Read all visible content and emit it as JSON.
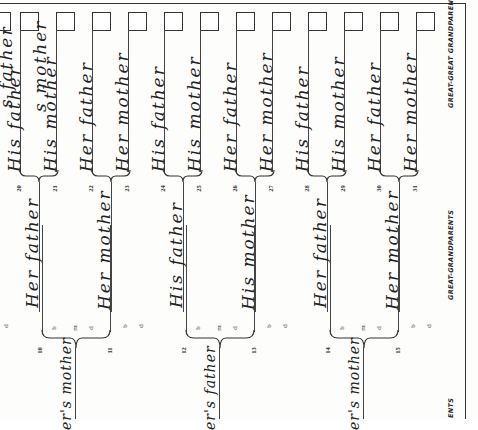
{
  "chart": {
    "title_columns": {
      "great_grandparents": "GREAT-GRANDPARENTS",
      "great_great_grandparents": "GREAT-GREAT GRANDPARENTS",
      "grandparents_partial": "ENTS"
    },
    "event_abbrev": {
      "birth": "b",
      "marriage": "m",
      "death": "d"
    },
    "great_great_grandparents": [
      {
        "number": "20",
        "label": "His father"
      },
      {
        "number": "21",
        "label": "His mother"
      },
      {
        "number": "22",
        "label": "Her father"
      },
      {
        "number": "23",
        "label": "Her mother"
      },
      {
        "number": "24",
        "label": "His father"
      },
      {
        "number": "25",
        "label": "His mother"
      },
      {
        "number": "26",
        "label": "Her father"
      },
      {
        "number": "27",
        "label": "Her mother"
      },
      {
        "number": "28",
        "label": "His father"
      },
      {
        "number": "29",
        "label": "His mother"
      },
      {
        "number": "30",
        "label": "Her father"
      },
      {
        "number": "31",
        "label": "Her mother"
      }
    ],
    "partial_top_labels": [
      {
        "label": "s father"
      },
      {
        "label": "s mother"
      }
    ],
    "great_grandparents": [
      {
        "number": "10",
        "label": "Her father"
      },
      {
        "number": "11",
        "label": "Her mother"
      },
      {
        "number": "12",
        "label": "His father"
      },
      {
        "number": "13",
        "label": "His mother"
      },
      {
        "number": "14",
        "label": "Her father"
      },
      {
        "number": "15",
        "label": "Her mother"
      }
    ],
    "grandparents_partial": [
      {
        "label": "er's mother"
      },
      {
        "label": "er's father"
      },
      {
        "label": "er's mother"
      }
    ]
  }
}
